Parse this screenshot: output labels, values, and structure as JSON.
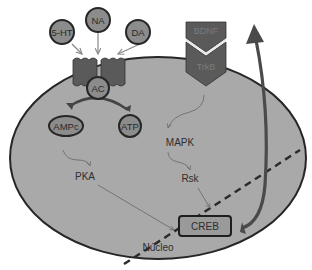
{
  "diagram": {
    "title": "",
    "colors": {
      "cell_fill": "#a9a9a9",
      "outline": "#262626",
      "receptor": "#5a5a5a",
      "node_fill": "#8c8c8c",
      "creb_fill": "#9a9a9a",
      "arrow_thin": "#6e6e6e",
      "arrow_thick": "#4a4a4a"
    },
    "ligands": [
      {
        "id": "5ht",
        "label": "5-HT"
      },
      {
        "id": "na",
        "label": "NA"
      },
      {
        "id": "da",
        "label": "DA"
      }
    ],
    "nodes": {
      "ac": "AC",
      "ampc": "AMPc",
      "atp": "ATP",
      "pka": "PKA",
      "mapk": "MAPK",
      "rsk": "Rsk",
      "creb": "CREB",
      "bdnf": "BDNF",
      "trkb": "TrkB",
      "nucleus": "Núcleo"
    },
    "edges": [
      {
        "from": "5-HT",
        "to": "receptor"
      },
      {
        "from": "NA",
        "to": "receptor"
      },
      {
        "from": "DA",
        "to": "receptor"
      },
      {
        "from": "ATP",
        "to": "AMPc",
        "via": "AC"
      },
      {
        "from": "AMPc",
        "to": "PKA"
      },
      {
        "from": "PKA",
        "to": "CREB"
      },
      {
        "from": "TrkB",
        "to": "MAPK"
      },
      {
        "from": "MAPK",
        "to": "Rsk"
      },
      {
        "from": "Rsk",
        "to": "CREB"
      },
      {
        "from": "CREB",
        "to": "BDNF"
      }
    ]
  }
}
